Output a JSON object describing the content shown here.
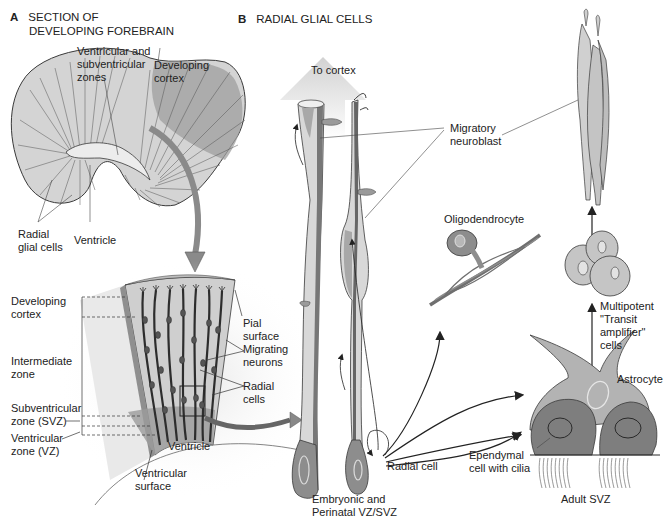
{
  "panel_a": {
    "letter": "A",
    "title_line1": "SECTION OF",
    "title_line2": "DEVELOPING FOREBRAIN",
    "labels": {
      "vz_svz_1": "Ventricular and",
      "vz_svz_2": "subventricular",
      "vz_svz_3": "zones",
      "dev_cortex_1": "Developing",
      "dev_cortex_2": "cortex",
      "radial_glial_1": "Radial",
      "radial_glial_2": "glial cells",
      "ventricle": "Ventricle"
    },
    "zones": {
      "developing_cortex_1": "Developing",
      "developing_cortex_2": "cortex",
      "intermediate_1": "Intermediate",
      "intermediate_2": "zone",
      "svz_1": "Subventricular",
      "svz_2": "zone (SVZ)",
      "vz_1": "Ventricular",
      "vz_2": "zone (VZ)"
    },
    "block_labels": {
      "pial_1": "Pial",
      "pial_2": "surface",
      "migrating_1": "Migrating",
      "migrating_2": "neurons",
      "radial_1": "Radial",
      "radial_2": "cells",
      "ventricle": "Ventricle",
      "vent_surface_1": "Ventricular",
      "vent_surface_2": "surface"
    }
  },
  "panel_b": {
    "letter": "B",
    "title": "RADIAL GLIAL CELLS",
    "labels": {
      "to_cortex": "To cortex",
      "migratory_1": "Migratory",
      "migratory_2": "neuroblast",
      "oligodendrocyte": "Oligodendrocyte",
      "multipotent_1": "Multipotent",
      "multipotent_2": "\"Transit",
      "multipotent_3": "amplifier\"",
      "multipotent_4": "cells",
      "astrocyte": "Astrocyte",
      "radial_cell": "Radial cell",
      "ependymal_1": "Ependymal",
      "ependymal_2": "cell with cilia",
      "embryonic_1": "Embryonic and",
      "embryonic_2": "Perinatal VZ/SVZ",
      "adult_svz": "Adult SVZ"
    }
  },
  "colors": {
    "tissue_light": "#d9d9d9",
    "tissue_mid": "#a6a6a6",
    "tissue_dark": "#6e6e6e",
    "outline": "#3a3a3a",
    "arrow_gray": "#8a8a8a"
  }
}
